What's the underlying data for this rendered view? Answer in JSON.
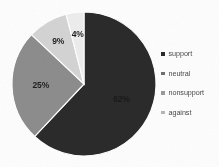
{
  "chart_data": {
    "type": "pie",
    "title": "",
    "categories": [
      "support",
      "neutral",
      "nonsupport",
      "against"
    ],
    "values": [
      62,
      25,
      9,
      4
    ],
    "value_labels": [
      "62%",
      "25%",
      "9%",
      "4%"
    ],
    "units": "percent",
    "start_angle_deg": 0,
    "direction": "clockwise",
    "legend_position": "right",
    "grid": false,
    "colors": [
      "#2b2b2b",
      "#8d8d8d",
      "#d4d4d4",
      "#ededed"
    ],
    "slices": [
      {
        "label": "support",
        "value": 62,
        "value_label": "62%",
        "color": "#2b2b2b",
        "label_color": "#1a1a1a"
      },
      {
        "label": "neutral",
        "value": 25,
        "value_label": "25%",
        "color": "#8d8d8d",
        "label_color": "#1f1f1f"
      },
      {
        "label": "nonsupport",
        "value": 9,
        "value_label": "9%",
        "color": "#d4d4d4",
        "label_color": "#1f1f1f"
      },
      {
        "label": "against",
        "value": 4,
        "value_label": "4%",
        "color": "#ededed",
        "label_color": "#1f1f1f"
      }
    ]
  },
  "legend": {
    "items": [
      {
        "label": "support",
        "swatch": "#2b2b2b"
      },
      {
        "label": "neutral",
        "swatch": "#6f6f6f"
      },
      {
        "label": "nonsupport",
        "swatch": "#9a9a9a"
      },
      {
        "label": "against",
        "swatch": "#b5b5b5"
      }
    ]
  },
  "canvas": {
    "background": "#fdfdfd",
    "center_x": 84,
    "center_y": 84,
    "radius": 72
  }
}
